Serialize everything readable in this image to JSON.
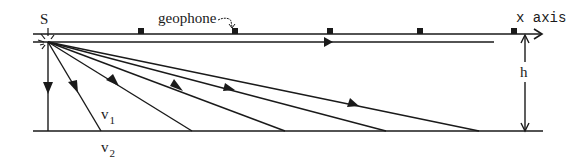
{
  "diagram": {
    "labels": {
      "source": "S",
      "geophone": "geophone",
      "x_axis": "x axis",
      "thickness": "h",
      "v1_base": "v",
      "v1_sub": "1",
      "v2_base": "v",
      "v2_sub": "2"
    },
    "colors": {
      "ink": "#1a1a1a",
      "background": "#ffffff"
    },
    "geometry": {
      "source": {
        "x": 48,
        "y": 42
      },
      "surface_line": {
        "x1": 33,
        "x2": 542,
        "y": 34
      },
      "refracted_head_wave_line": {
        "x1": 33,
        "x2": 494,
        "y": 42
      },
      "interface_line": {
        "x1": 33,
        "x2": 543,
        "y": 131
      },
      "geophones_x": [
        141,
        235,
        330,
        420,
        514
      ],
      "rays_end_x": [
        48,
        101,
        192,
        285,
        386,
        479
      ],
      "ray_arrows": [
        {
          "x": 48,
          "y": 88
        },
        {
          "x": 73,
          "y": 87
        },
        {
          "x": 113,
          "y": 82
        },
        {
          "x": 176,
          "y": 90
        },
        {
          "x": 228,
          "y": 88
        },
        {
          "x": 352,
          "y": 104
        }
      ],
      "h_arrow": {
        "x": 525,
        "y1": 36,
        "y2": 131
      }
    }
  }
}
